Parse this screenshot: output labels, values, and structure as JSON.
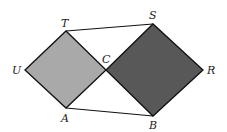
{
  "diagram": {
    "type": "geometry",
    "colors": {
      "small_square": "#a9a9a9",
      "large_square": "#585858",
      "stroke": "#111111",
      "background": "#ffffff"
    },
    "points": {
      "U": {
        "label": "U",
        "x": 25,
        "y": 70
      },
      "T": {
        "label": "T",
        "x": 66,
        "y": 31
      },
      "C": {
        "label": "C",
        "x": 106,
        "y": 70
      },
      "A": {
        "label": "A",
        "x": 66,
        "y": 108
      },
      "S": {
        "label": "S",
        "x": 153,
        "y": 24
      },
      "R": {
        "label": "R",
        "x": 203,
        "y": 70
      },
      "B": {
        "label": "B",
        "x": 153,
        "y": 116
      }
    },
    "shapes": [
      {
        "name": "square-UTCA",
        "vertices": [
          "U",
          "T",
          "C",
          "A"
        ],
        "fill": "light gray"
      },
      {
        "name": "square-CSRB",
        "vertices": [
          "C",
          "S",
          "R",
          "B"
        ],
        "fill": "dark gray"
      }
    ],
    "segments": [
      [
        "T",
        "S"
      ],
      [
        "A",
        "B"
      ]
    ]
  }
}
